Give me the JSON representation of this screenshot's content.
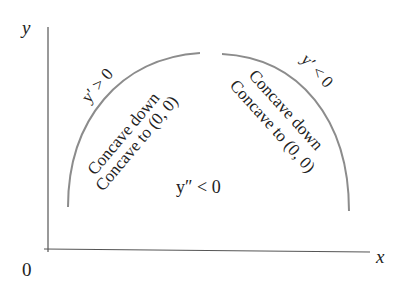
{
  "diagram": {
    "axes": {
      "y_label": "y",
      "x_label": "x",
      "origin_label": "0"
    },
    "left_arc": {
      "slope_label": "y′ > 0",
      "line1": "Concave down",
      "line2": "Concave to (0, 0)"
    },
    "right_arc": {
      "slope_label": "y′ < 0",
      "line1": "Concave down",
      "line2": "Concave to (0, 0)"
    },
    "center_label": "y″ < 0",
    "colors": {
      "axis": "#555555",
      "curve": "#8c8c8c",
      "text": "#222222"
    }
  }
}
